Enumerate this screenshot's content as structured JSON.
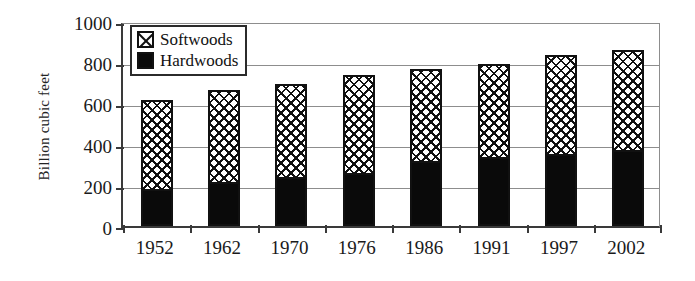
{
  "chart_data": {
    "type": "bar",
    "stacked": true,
    "title": "",
    "xlabel": "",
    "ylabel": "Billion cubic feet",
    "ylim": [
      0,
      1000
    ],
    "yticks": [
      0,
      200,
      400,
      600,
      800,
      1000
    ],
    "ytick_labels": [
      "0",
      "200",
      "400",
      "600",
      "800",
      "1000"
    ],
    "grid": "horizontal",
    "legend_position": "top-left",
    "categories": [
      "1952",
      "1962",
      "1970",
      "1976",
      "1986",
      "1991",
      "1997",
      "2002"
    ],
    "series": [
      {
        "name": "Hardwoods",
        "color": "#0a0a0a",
        "fill": "solid-black",
        "values": [
          180,
          215,
          240,
          260,
          315,
          335,
          350,
          370
        ]
      },
      {
        "name": "Softwoods",
        "color": "#ffffff",
        "fill": "cross-hatch",
        "values": [
          435,
          450,
          455,
          475,
          450,
          455,
          485,
          490
        ]
      }
    ],
    "totals": [
      615,
      665,
      695,
      735,
      765,
      790,
      835,
      860
    ]
  },
  "legend": {
    "entries": [
      {
        "label": "Softwoods",
        "swatch": "cross-hatch-swatch"
      },
      {
        "label": "Hardwoods",
        "swatch": "solid-black-swatch"
      }
    ]
  }
}
